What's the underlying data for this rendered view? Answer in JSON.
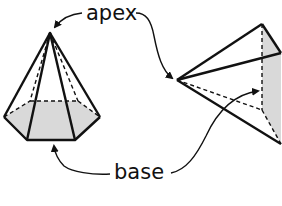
{
  "labels": {
    "apex": "apex",
    "base": "base"
  },
  "colors": {
    "stroke": "#111111",
    "base_fill": "#d9d9d9",
    "background": "#ffffff"
  },
  "figures": [
    {
      "name": "hexagonal-pyramid",
      "apex": [
        50,
        33
      ],
      "base_vertices": [
        [
          4,
          117
        ],
        [
          27,
          140
        ],
        [
          75,
          140
        ],
        [
          100,
          117
        ],
        [
          78,
          101
        ],
        [
          30,
          101
        ]
      ]
    },
    {
      "name": "triangular-pyramid",
      "apex": [
        177,
        80
      ],
      "base_vertices": [
        [
          262,
          24
        ],
        [
          281,
          53
        ],
        [
          281,
          144
        ],
        [
          262,
          110
        ]
      ]
    }
  ]
}
